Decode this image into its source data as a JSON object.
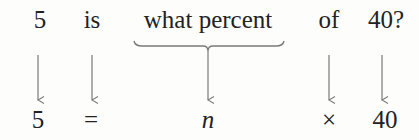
{
  "sentence": {
    "words": [
      {
        "text": "5",
        "x": 40
      },
      {
        "text": "is",
        "x": 92
      },
      {
        "text": "what percent",
        "x": 208
      },
      {
        "text": "of",
        "x": 329
      },
      {
        "text": "40?",
        "x": 386
      }
    ]
  },
  "equation": {
    "terms": [
      {
        "text": "5",
        "x": 38
      },
      {
        "text": "=",
        "x": 91
      },
      {
        "text": "n",
        "x": 208,
        "italic": true
      },
      {
        "text": "×",
        "x": 329
      },
      {
        "text": "40",
        "x": 385
      }
    ]
  },
  "colors": {
    "text": "#222222",
    "arrow": "#7a7a7a",
    "background": "#fdfdfb"
  }
}
